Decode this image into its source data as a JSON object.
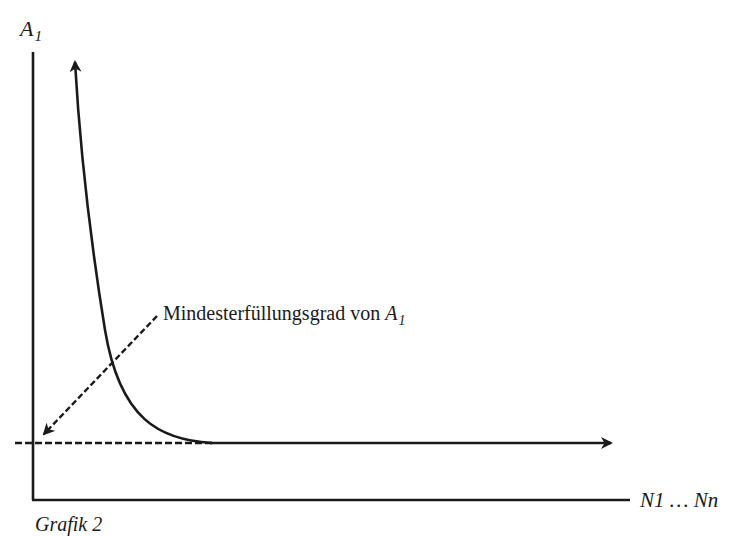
{
  "diagram": {
    "y_axis": {
      "label_main": "A",
      "label_sub": "1"
    },
    "x_axis": {
      "label": "N1 … Nn"
    },
    "annotation": {
      "text": "Mindesterfüllungsgrad von ",
      "var_main": "A",
      "var_sub": "1"
    },
    "caption": "Grafik 2",
    "line_color": "#1a1a1a",
    "curve": {
      "description": "hyperbolic decreasing curve approaching minimum level, then continuing horizontally as arrow"
    },
    "minimum_line": {
      "style": "dashed",
      "description": "dashed horizontal line at minimum fulfillment level"
    }
  }
}
